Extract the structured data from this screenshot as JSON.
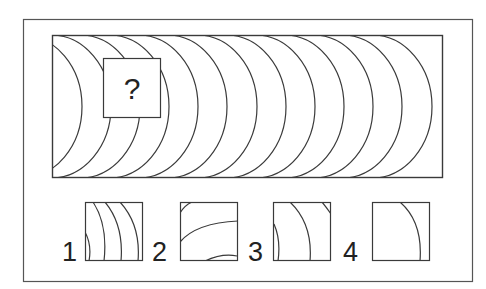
{
  "puzzle": {
    "question_mark": "?",
    "pattern": {
      "arc_count": 13,
      "arc_apex_x": [
        82,
        111,
        140,
        169,
        198,
        227,
        257,
        286,
        315,
        344,
        373,
        402,
        432
      ],
      "arc_horizontal_radius": 60
    },
    "options": [
      {
        "label": "1"
      },
      {
        "label": "2"
      },
      {
        "label": "3"
      },
      {
        "label": "4"
      }
    ]
  },
  "colors": {
    "stroke": "#3a3a3a",
    "frame": "#555555",
    "background": "#ffffff"
  }
}
